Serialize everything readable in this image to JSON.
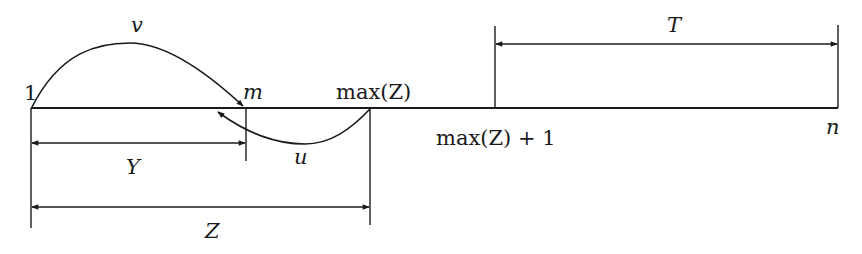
{
  "diagram": {
    "type": "number-line interval diagram",
    "labels": {
      "start": "1",
      "m": "m",
      "maxZ": "max(Z)",
      "maxZ_plus_1": "max(Z) + 1",
      "end": "n",
      "arc_v": "v",
      "arc_u": "u",
      "span_Y": "Y",
      "span_Z": "Z",
      "span_T": "T"
    },
    "points": [
      {
        "id": "start",
        "label": "1",
        "x": 31
      },
      {
        "id": "m",
        "label": "m",
        "x": 246
      },
      {
        "id": "maxZ",
        "label": "max(Z)",
        "x": 370
      },
      {
        "id": "maxZ_plus_1",
        "label": "max(Z) + 1",
        "x": 495
      },
      {
        "id": "end",
        "label": "n",
        "x": 838
      }
    ],
    "arcs": [
      {
        "label": "v",
        "from": "1",
        "to": "m",
        "side": "above"
      },
      {
        "label": "u",
        "from": "max(Z)",
        "to": "before m",
        "side": "below"
      }
    ],
    "spans": [
      {
        "label": "Y",
        "from": "1",
        "to": "m"
      },
      {
        "label": "Z",
        "from": "1",
        "to": "max(Z)"
      },
      {
        "label": "T",
        "from": "max(Z) + 1",
        "to": "n"
      }
    ],
    "colors": {
      "ink": "#1a1a1a",
      "background": "#ffffff"
    }
  }
}
